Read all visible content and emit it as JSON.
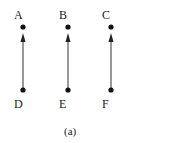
{
  "diagram": {
    "caption": "(a)",
    "nodes": [
      {
        "id": "A",
        "label": "A",
        "x": 23,
        "y": 27,
        "lx": 14,
        "ly": 9
      },
      {
        "id": "B",
        "label": "B",
        "x": 68,
        "y": 27,
        "lx": 59,
        "ly": 9
      },
      {
        "id": "C",
        "label": "C",
        "x": 111,
        "y": 27,
        "lx": 102,
        "ly": 9
      },
      {
        "id": "D",
        "label": "D",
        "x": 23,
        "y": 90,
        "lx": 14,
        "ly": 98
      },
      {
        "id": "E",
        "label": "E",
        "x": 68,
        "y": 90,
        "lx": 59,
        "ly": 98
      },
      {
        "id": "F",
        "label": "F",
        "x": 111,
        "y": 90,
        "lx": 102,
        "ly": 98
      }
    ],
    "edges": [
      {
        "from": "D",
        "to": "A",
        "directed": true
      },
      {
        "from": "E",
        "to": "B",
        "directed": true
      },
      {
        "from": "F",
        "to": "C",
        "directed": true
      }
    ]
  }
}
